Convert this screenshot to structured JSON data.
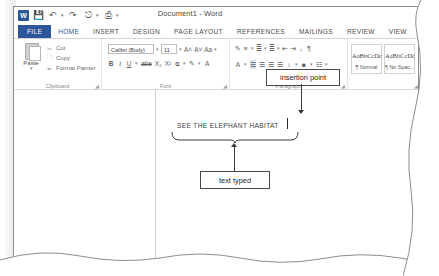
{
  "window": {
    "title": "Document1 - Word",
    "quick_access": [
      {
        "name": "word-app-icon",
        "glyph": "W"
      },
      {
        "name": "save-icon",
        "glyph": "ὋE"
      },
      {
        "name": "undo-icon",
        "glyph": "↶"
      },
      {
        "name": "redo-icon",
        "glyph": "↷"
      },
      {
        "name": "touch-mode-icon",
        "glyph": "↖"
      },
      {
        "name": "print-preview-icon",
        "glyph": "⎙"
      },
      {
        "name": "customize-qat-icon",
        "glyph": "▾"
      }
    ]
  },
  "ribbon": {
    "tabs": [
      {
        "label": "FILE",
        "state": "file"
      },
      {
        "label": "HOME",
        "state": "active"
      },
      {
        "label": "INSERT",
        "state": "normal"
      },
      {
        "label": "DESIGN",
        "state": "normal"
      },
      {
        "label": "PAGE LAYOUT",
        "state": "normal"
      },
      {
        "label": "REFERENCES",
        "state": "normal"
      },
      {
        "label": "MAILINGS",
        "state": "normal"
      },
      {
        "label": "REVIEW",
        "state": "normal"
      },
      {
        "label": "VIEW",
        "state": "normal"
      }
    ],
    "groups": {
      "clipboard": {
        "label": "Clipboard",
        "paste_label": "Paste",
        "items": [
          {
            "label": "Cut",
            "icon": "scissors-icon"
          },
          {
            "label": "Copy",
            "icon": "copy-icon"
          },
          {
            "label": "Format Painter",
            "icon": "format-painter-icon"
          }
        ]
      },
      "font": {
        "label": "Font",
        "font_name": "Calibri (Body)",
        "font_size": "11",
        "buttons_row1": [
          "grow-font-icon",
          "shrink-font-icon",
          "change-case-icon"
        ],
        "buttons_row2": [
          "bold-icon",
          "italic-icon",
          "underline-icon",
          "strikethrough-icon",
          "subscript-icon",
          "superscript-icon",
          "text-effects-icon",
          "text-highlight-icon",
          "font-color-icon"
        ],
        "row1_glyphs": [
          "A˄",
          "A˅",
          "Aa"
        ],
        "row2_glyphs": [
          "B",
          "I",
          "U",
          "abe",
          "X₂",
          "X²"
        ]
      },
      "paragraph": {
        "label": "Paragraph",
        "buttons_row1": [
          "bullets-icon",
          "numbering-icon",
          "multilevel-list-icon",
          "decrease-indent-icon",
          "increase-indent-icon",
          "sort-icon",
          "show-formatting-marks-icon"
        ],
        "buttons_row2": [
          "align-left-icon",
          "center-icon",
          "align-right-icon",
          "justify-icon",
          "line-spacing-icon",
          "shading-icon",
          "borders-icon"
        ]
      },
      "styles": {
        "label": "Styles",
        "tiles": [
          {
            "sample": "AaBbCcDc",
            "name": "¶ Normal"
          },
          {
            "sample": "AaBbCcDc",
            "name": "¶ No Spac..."
          }
        ]
      }
    }
  },
  "document": {
    "typed_text": "SEE THE ELEPHANT HABITAT"
  },
  "annotations": [
    {
      "id": "insertion-point",
      "label": "insertion point"
    },
    {
      "id": "text-typed",
      "label": "text typed"
    }
  ],
  "colors": {
    "accent": "#2b579a",
    "annotation": "#3a3a3a",
    "text": "#3d3d3d"
  }
}
